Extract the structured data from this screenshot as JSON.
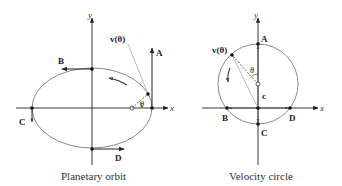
{
  "panels": [
    {
      "caption": "Planetary orbit",
      "axis_x": "x",
      "axis_y": "y",
      "points": {
        "A": "A",
        "B": "B",
        "C": "C",
        "D": "D"
      },
      "velocity_label": "v(θ)",
      "angle_label": "θ"
    },
    {
      "caption": "Velocity circle",
      "axis_x": "x",
      "axis_y": "y",
      "points": {
        "A": "A",
        "B": "B",
        "C": "C",
        "D": "D"
      },
      "velocity_label": "v(θ)",
      "angle_label": "θ",
      "center_label": "c"
    }
  ],
  "colors": {
    "axis": "#222222",
    "curve": "#8a8a8a",
    "gray_line": "#b5b5b5",
    "text": "#222222"
  }
}
